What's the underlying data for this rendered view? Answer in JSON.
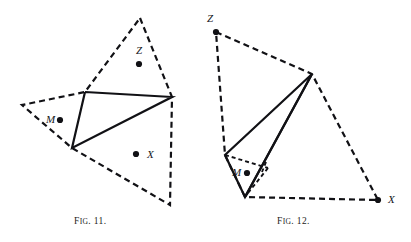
{
  "plate": {
    "background": "#ffffff",
    "ink": "#111115",
    "width": 411,
    "height": 242
  },
  "figures": [
    {
      "id": "fig-11",
      "caption_prefix": "F",
      "caption_small": "IG",
      "caption_number": ". 11.",
      "caption_text": "FIG. 11.",
      "points": [
        {
          "label": "Z",
          "label_x": 136,
          "label_y": 54,
          "dot_x": 139,
          "dot_y": 64
        },
        {
          "label": "M",
          "label_x": 46,
          "label_y": 123,
          "dot_x": 60,
          "dot_y": 120
        },
        {
          "label": "X",
          "label_x": 147,
          "label_y": 158,
          "dot_x": 136,
          "dot_y": 154
        }
      ],
      "dashed_outline": [
        [
          140,
          18
        ],
        [
          172,
          97
        ],
        [
          170,
          205
        ],
        [
          72,
          148
        ],
        [
          22,
          105
        ],
        [
          85,
          92
        ]
      ],
      "solid_triangle": [
        [
          85,
          92
        ],
        [
          172,
          97
        ],
        [
          72,
          148
        ]
      ]
    },
    {
      "id": "fig-12",
      "caption_prefix": "F",
      "caption_small": "IG",
      "caption_number": ". 12.",
      "caption_text": "FIG. 12.",
      "points": [
        {
          "label": "Z",
          "label_x": 207,
          "label_y": 22,
          "dot_x": 216,
          "dot_y": 32
        },
        {
          "label": "M",
          "label_x": 232,
          "label_y": 176,
          "dot_x": 247,
          "dot_y": 173
        },
        {
          "label": "X",
          "label_x": 388,
          "label_y": 203,
          "dot_x": 378,
          "dot_y": 200
        }
      ],
      "dashed_outline": [
        [
          216,
          32
        ],
        [
          312,
          74
        ],
        [
          378,
          200
        ],
        [
          245,
          197
        ],
        [
          225,
          155
        ],
        [
          216,
          32
        ]
      ],
      "solid_paths": [
        [
          [
            312,
            74
          ],
          [
            225,
            155
          ],
          [
            245,
            197
          ],
          [
            312,
            74
          ]
        ],
        [
          [
            312,
            74
          ],
          [
            245,
            197
          ]
        ]
      ],
      "dashed_inner": [
        [
          [
            225,
            155
          ],
          [
            268,
            168
          ]
        ],
        [
          [
            268,
            168
          ],
          [
            248,
            193
          ]
        ],
        [
          [
            248,
            193
          ],
          [
            245,
            197
          ]
        ],
        [
          [
            266,
            162
          ],
          [
            262,
            172
          ]
        ]
      ]
    }
  ],
  "style": {
    "dash_pattern": "6 4",
    "dash_width": 2.2,
    "solid_width": 2.2,
    "inner_dash_pattern": "4 3",
    "inner_dash_width": 1.9,
    "dot_radius": 3.1
  }
}
